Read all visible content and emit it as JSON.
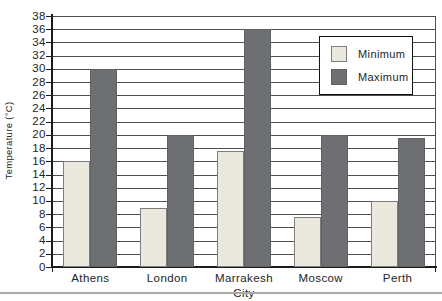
{
  "chart_data": {
    "type": "bar",
    "title": "",
    "xlabel": "City",
    "ylabel": "Temperature (°C)",
    "categories": [
      "Athens",
      "London",
      "Marrakesh",
      "Moscow",
      "Perth"
    ],
    "series": [
      {
        "name": "Minimum",
        "values": [
          16,
          9,
          17.5,
          7.5,
          10
        ]
      },
      {
        "name": "Maximum",
        "values": [
          30,
          20,
          36,
          20,
          19.5
        ]
      }
    ],
    "ylim": [
      0,
      38
    ],
    "ytick_step": 2,
    "grid": true,
    "legend_position": "upper right"
  },
  "colors": {
    "minimum_fill": "#ebe9dd",
    "minimum_border": "#7e7e7e",
    "maximum_fill": "#6e6f72",
    "gridline": "#4f4f4f",
    "axis": "#1c1c1c",
    "background": "#ffffff"
  }
}
